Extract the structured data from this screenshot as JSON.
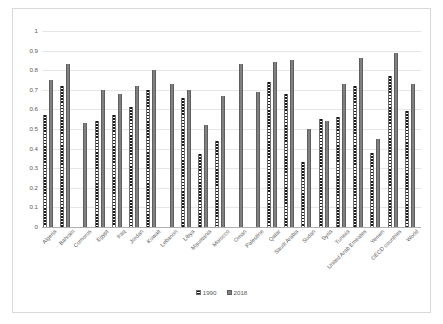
{
  "chart_data": {
    "type": "bar",
    "title": "",
    "subtitle": "",
    "xlabel": "",
    "ylabel": "",
    "ylim": [
      0,
      1
    ],
    "yticks": [
      0,
      0.1,
      0.2,
      0.3,
      0.4,
      0.5,
      0.6,
      0.7,
      0.8,
      0.9,
      1
    ],
    "ytick_labels": [
      "0",
      "0.1",
      "0.2",
      "0.3",
      "0.4",
      "0.5",
      "0.6",
      "0.7",
      "0.8",
      "0.9",
      "1"
    ],
    "grid": true,
    "legend_position": "bottom",
    "categories": [
      "Algeria",
      "Bahrain",
      "Comoros",
      "Egypt",
      "Iraq",
      "Jordan",
      "Kuwait",
      "Lebanon",
      "Libya",
      "Mauritania",
      "Morocco",
      "Oman",
      "Palestine",
      "Qatar",
      "Saudi Arabia",
      "Sudan",
      "Syria",
      "Tunisia",
      "United Arab Emirates",
      "Yemen",
      "OECD countries",
      "World"
    ],
    "series": [
      {
        "name": "1990",
        "color": "#1a1a1a",
        "pattern": "horizontal-hatch",
        "values": [
          0.57,
          0.72,
          null,
          0.54,
          0.57,
          0.61,
          0.7,
          null,
          0.66,
          0.37,
          0.44,
          null,
          null,
          0.74,
          0.68,
          0.33,
          0.55,
          0.56,
          0.72,
          0.38,
          0.77,
          0.59
        ]
      },
      {
        "name": "2018",
        "color": "#808080",
        "pattern": "solid",
        "values": [
          0.75,
          0.83,
          0.53,
          0.7,
          0.68,
          0.72,
          0.8,
          0.73,
          0.7,
          0.52,
          0.67,
          0.83,
          0.69,
          0.84,
          0.85,
          0.5,
          0.54,
          0.73,
          0.86,
          0.45,
          0.89,
          0.73
        ]
      }
    ]
  },
  "legend": {
    "items": [
      {
        "label": "1990",
        "swatch": "hatched-swatch"
      },
      {
        "label": "2018",
        "swatch": "solid-gray-swatch"
      }
    ]
  }
}
